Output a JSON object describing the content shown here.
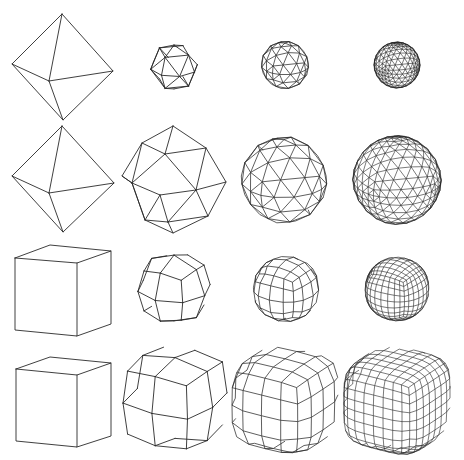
{
  "figure": {
    "width": 464,
    "height": 460,
    "background": "#ffffff",
    "stroke_color": "#2a2a2a",
    "rows": [
      {
        "name": "octahedron-subdivision-sphere",
        "cells": [
          {
            "type": "octahedron",
            "cx": 62,
            "cy": 67,
            "level": 0
          },
          {
            "type": "tri-sphere",
            "cx": 174,
            "cy": 67,
            "r": 24,
            "level": 1
          },
          {
            "type": "tri-sphere",
            "cx": 285,
            "cy": 65,
            "r": 24,
            "level": 2
          },
          {
            "type": "tri-sphere",
            "cx": 397,
            "cy": 65,
            "r": 23,
            "level": 3
          }
        ]
      },
      {
        "name": "octahedron-subdivision-smooth",
        "cells": [
          {
            "type": "octahedron",
            "cx": 62,
            "cy": 179,
            "level": 0
          },
          {
            "type": "tri-blob",
            "cx": 174,
            "cy": 180,
            "r": 53,
            "level": 1
          },
          {
            "type": "tri-blob",
            "cx": 284,
            "cy": 180,
            "r": 54,
            "level": 2
          },
          {
            "type": "tri-blob",
            "cx": 397,
            "cy": 180,
            "r": 55,
            "level": 3
          }
        ]
      },
      {
        "name": "cube-subdivision-sphere",
        "cells": [
          {
            "type": "cube",
            "x": 15,
            "y": 245,
            "level": 0
          },
          {
            "type": "quad-sphere",
            "cx": 174,
            "cy": 288,
            "r": 36,
            "level": 1
          },
          {
            "type": "quad-sphere",
            "cx": 286,
            "cy": 289,
            "r": 32,
            "level": 2
          },
          {
            "type": "quad-sphere",
            "cx": 397,
            "cy": 289,
            "r": 31,
            "level": 3
          }
        ]
      },
      {
        "name": "cube-subdivision-smooth",
        "cells": [
          {
            "type": "cube",
            "x": 16,
            "y": 357,
            "level": 0
          },
          {
            "type": "quad-blob",
            "cx": 175,
            "cy": 398,
            "r": 54,
            "level": 1
          },
          {
            "type": "quad-blob",
            "cx": 285,
            "cy": 400,
            "r": 55,
            "level": 2
          },
          {
            "type": "quad-blob",
            "cx": 397,
            "cy": 400,
            "r": 55,
            "level": 3
          }
        ]
      }
    ]
  }
}
